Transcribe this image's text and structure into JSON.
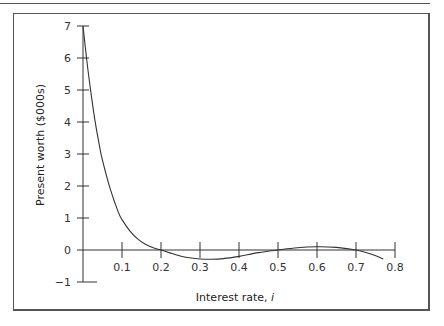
{
  "chart_data": {
    "type": "line",
    "title": "",
    "xlabel": "Interest rate, ",
    "xlabel_italic": "i",
    "ylabel": "Present worth ($000s)",
    "xlim": [
      0,
      0.8
    ],
    "ylim": [
      -1,
      7
    ],
    "grid": false,
    "legend": null,
    "x_ticks": [
      "0.1",
      "0.2",
      "0.3",
      "0.4",
      "0.5",
      "0.6",
      "0.7",
      "0.8"
    ],
    "x_tick_values": [
      0.1,
      0.2,
      0.3,
      0.4,
      0.5,
      0.6,
      0.7,
      0.8
    ],
    "y_ticks": [
      "7",
      "6",
      "5",
      "4",
      "3",
      "2",
      "1",
      "0",
      "−1"
    ],
    "y_tick_values": [
      7,
      6,
      5,
      4,
      3,
      2,
      1,
      0,
      -1
    ],
    "series": [
      {
        "name": "Present worth",
        "x": [
          0.0,
          0.01,
          0.02,
          0.03,
          0.04,
          0.05,
          0.07,
          0.09,
          0.1,
          0.12,
          0.14,
          0.16,
          0.18,
          0.2,
          0.23,
          0.26,
          0.3,
          0.33,
          0.36,
          0.4,
          0.45,
          0.5,
          0.55,
          0.6,
          0.65,
          0.7,
          0.74,
          0.77
        ],
        "values": [
          7.0,
          5.9,
          4.95,
          4.1,
          3.4,
          2.8,
          1.9,
          1.2,
          0.95,
          0.6,
          0.35,
          0.18,
          0.07,
          0.0,
          -0.12,
          -0.22,
          -0.28,
          -0.29,
          -0.27,
          -0.2,
          -0.08,
          0.0,
          0.07,
          0.1,
          0.08,
          0.0,
          -0.13,
          -0.28
        ]
      }
    ]
  }
}
